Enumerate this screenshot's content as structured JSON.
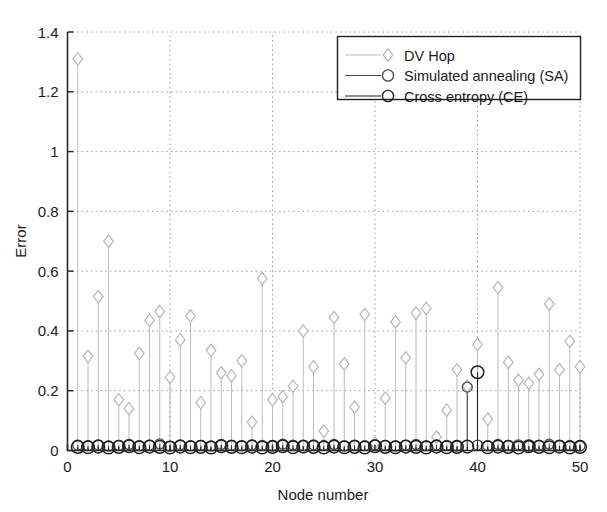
{
  "chart_data": {
    "type": "line",
    "title": "",
    "xlabel": "Node number",
    "ylabel": "Error",
    "xlim": [
      0,
      50
    ],
    "ylim": [
      0,
      1.4
    ],
    "xticks": [
      0,
      10,
      20,
      30,
      40,
      50
    ],
    "yticks": [
      0,
      0.2,
      0.4,
      0.6,
      0.8,
      1,
      1.2,
      1.4
    ],
    "xtick_labels": [
      "0",
      "10",
      "20",
      "30",
      "40",
      "50"
    ],
    "ytick_labels": [
      "0",
      "0.2",
      "0.4",
      "0.6",
      "0.8",
      "1",
      "1.2",
      "1.4"
    ],
    "grid": true,
    "grid_style": "dotted",
    "legend_position": "top-right",
    "x": [
      1,
      2,
      3,
      4,
      5,
      6,
      7,
      8,
      9,
      10,
      11,
      12,
      13,
      14,
      15,
      16,
      17,
      18,
      19,
      20,
      21,
      22,
      23,
      24,
      25,
      26,
      27,
      28,
      29,
      30,
      31,
      32,
      33,
      34,
      35,
      36,
      37,
      38,
      39,
      40,
      41,
      42,
      43,
      44,
      45,
      46,
      47,
      48,
      49,
      50
    ],
    "series": [
      {
        "name": "DV Hop",
        "marker": "diamond",
        "color": "#b4b4b4",
        "values": [
          1.31,
          0.315,
          0.515,
          0.7,
          0.17,
          0.14,
          0.325,
          0.435,
          0.465,
          0.245,
          0.37,
          0.45,
          0.16,
          0.335,
          0.26,
          0.25,
          0.3,
          0.095,
          0.575,
          0.17,
          0.18,
          0.215,
          0.4,
          0.28,
          0.065,
          0.445,
          0.29,
          0.145,
          0.455,
          0.025,
          0.175,
          0.43,
          0.31,
          0.46,
          0.475,
          0.045,
          0.135,
          0.27,
          0.215,
          0.355,
          0.105,
          0.545,
          0.295,
          0.235,
          0.225,
          0.255,
          0.49,
          0.27,
          0.365,
          0.28
        ]
      },
      {
        "name": "Simulated annealing (SA)",
        "marker": "circle",
        "color": "#4a4a4a",
        "values": [
          0.018,
          0.016,
          0.019,
          0.015,
          0.017,
          0.02,
          0.016,
          0.018,
          0.022,
          0.014,
          0.019,
          0.016,
          0.017,
          0.015,
          0.02,
          0.018,
          0.016,
          0.019,
          0.017,
          0.015,
          0.021,
          0.018,
          0.016,
          0.019,
          0.017,
          0.02,
          0.015,
          0.018,
          0.016,
          0.019,
          0.017,
          0.015,
          0.018,
          0.02,
          0.016,
          0.019,
          0.017,
          0.015,
          0.212,
          0.018,
          0.016,
          0.02,
          0.017,
          0.019,
          0.015,
          0.018,
          0.021,
          0.016,
          0.017,
          0.015
        ]
      },
      {
        "name": "Cross entropy (CE)",
        "marker": "circle",
        "color": "#1f1f1f",
        "values": [
          0.012,
          0.011,
          0.013,
          0.01,
          0.012,
          0.014,
          0.011,
          0.013,
          0.012,
          0.01,
          0.013,
          0.011,
          0.012,
          0.01,
          0.014,
          0.012,
          0.011,
          0.013,
          0.01,
          0.012,
          0.014,
          0.011,
          0.013,
          0.012,
          0.01,
          0.013,
          0.011,
          0.012,
          0.01,
          0.014,
          0.012,
          0.011,
          0.013,
          0.012,
          0.01,
          0.013,
          0.011,
          0.012,
          0.013,
          0.262,
          0.011,
          0.013,
          0.012,
          0.01,
          0.014,
          0.012,
          0.011,
          0.013,
          0.01,
          0.012
        ]
      }
    ]
  },
  "legend": {
    "entries": [
      {
        "label": "DV Hop",
        "marker": "diamond-marker",
        "color": "#b4b4b4"
      },
      {
        "label": "Simulated annealing (SA)",
        "marker": "circle-marker",
        "color": "#4a4a4a"
      },
      {
        "label": "Cross entropy (CE)",
        "marker": "circle-marker",
        "color": "#1f1f1f"
      }
    ]
  },
  "axes": {
    "x_title": "Node number",
    "y_title": "Error"
  }
}
